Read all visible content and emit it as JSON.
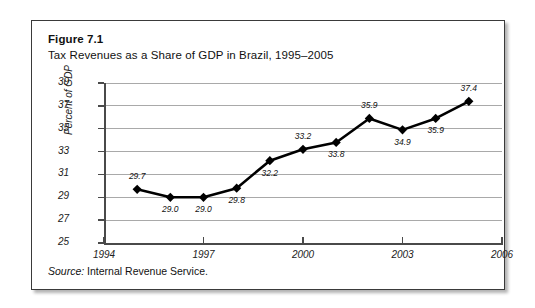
{
  "figure": {
    "label": "Figure 7.1",
    "title": "Tax Revenues as a Share of GDP in Brazil, 1995–2005",
    "source_word": "Source:",
    "source_text": " Internal Revenue Service."
  },
  "chart_data": {
    "type": "line",
    "title": "Tax Revenues as a Share of GDP in Brazil, 1995–2005",
    "xlabel": "",
    "ylabel": "Percent of GDP",
    "x": [
      1995,
      1996,
      1997,
      1998,
      1999,
      2000,
      2001,
      2002,
      2003,
      2004,
      2005
    ],
    "values": [
      29.7,
      29.0,
      29.0,
      29.8,
      32.2,
      33.2,
      33.8,
      35.9,
      34.9,
      35.9,
      37.4
    ],
    "point_labels": [
      "29.7",
      "29.0",
      "29.0",
      "29.8",
      "32.2",
      "33.2",
      "33.8",
      "35.9",
      "34.9",
      "35.9",
      "37.4"
    ],
    "label_positions": [
      "above",
      "below",
      "below",
      "below",
      "below",
      "above",
      "below",
      "above",
      "below",
      "below",
      "above"
    ],
    "xlim": [
      1994,
      2006
    ],
    "ylim": [
      25,
      39
    ],
    "xticks": [
      "1994",
      "1997",
      "2000",
      "2003",
      "2006"
    ],
    "xtick_values": [
      1994,
      1997,
      2000,
      2003,
      2006
    ],
    "yticks": [
      "25",
      "27",
      "29",
      "31",
      "33",
      "35",
      "37",
      "39"
    ],
    "ytick_values": [
      25,
      27,
      29,
      31,
      33,
      35,
      37,
      39
    ],
    "grid": "horizontal",
    "legend": "none",
    "marker": "diamond",
    "series_color": "#000000",
    "grid_color": "#a9a9a9",
    "axis_color": "#4a4a4a"
  }
}
